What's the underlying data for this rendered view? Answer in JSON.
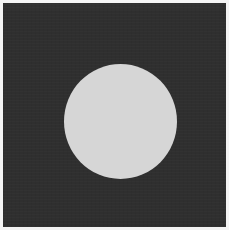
{
  "image": {
    "description": "Light gray filled circle centered on a dark charcoal square with a thin light border",
    "colors": {
      "border": "#f4f4f4",
      "background_square": "#2f2f2f",
      "circle": "#d6d6d6"
    },
    "shapes": [
      {
        "type": "rect",
        "name": "dark-square",
        "x": 3,
        "y": 3,
        "width": 223,
        "height": 224
      },
      {
        "type": "circle",
        "name": "light-circle",
        "cx": 117,
        "cy": 118,
        "rx": 56,
        "ry": 57
      }
    ]
  }
}
